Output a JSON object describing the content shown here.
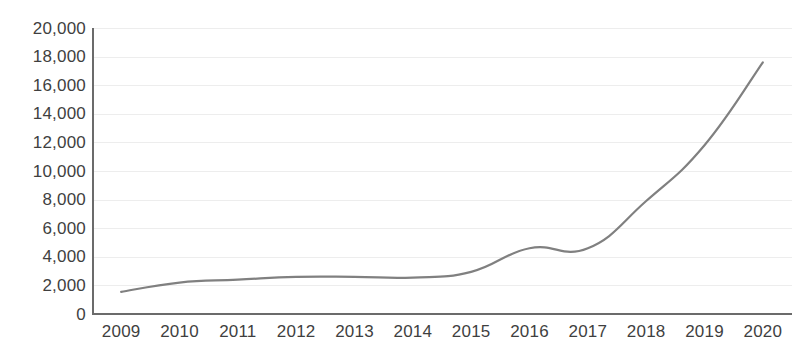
{
  "chart_data": {
    "type": "line",
    "title": "",
    "subtitle": "",
    "xlabel": "",
    "ylabel": "",
    "categories": [
      "2009",
      "2010",
      "2011",
      "2012",
      "2013",
      "2014",
      "2015",
      "2016",
      "2017",
      "2018",
      "2019",
      "2020"
    ],
    "series": [
      {
        "name": "",
        "values": [
          1550,
          2200,
          2400,
          2600,
          2600,
          2550,
          2950,
          4600,
          4600,
          7900,
          11800,
          17600
        ]
      }
    ],
    "ylim": [
      0,
      20000
    ],
    "ytick_values": [
      0,
      2000,
      4000,
      6000,
      8000,
      10000,
      12000,
      14000,
      16000,
      18000,
      20000
    ],
    "ytick_labels": [
      "0",
      "2,000",
      "4,000",
      "6,000",
      "8,000",
      "10,000",
      "12,000",
      "14,000",
      "16,000",
      "18,000",
      "20,000"
    ],
    "grid": "horizontal",
    "legend": "none",
    "line_color": "#808080",
    "grid_color": "#ededed",
    "axis_color": "#6b6b6b",
    "label_color": "#3f3f3f",
    "background_color": "#ffffff",
    "smoothing": "spline",
    "markers": "none"
  }
}
